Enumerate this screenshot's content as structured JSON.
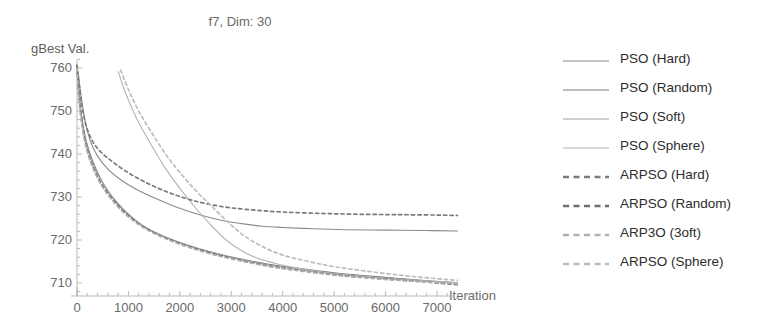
{
  "chart_data": {
    "type": "line",
    "title": "f7, Dim: 30",
    "xlabel": "Iteration",
    "ylabel": "gBest Val.",
    "xlim": [
      0,
      7700
    ],
    "ylim": [
      705,
      762
    ],
    "xticks": [
      0,
      1000,
      2000,
      3000,
      4000,
      5000,
      6000,
      7000
    ],
    "yticks": [
      710,
      720,
      730,
      740,
      750,
      760
    ],
    "grid": false,
    "legend_position": "right",
    "series": [
      {
        "name": "PSO (Hard)",
        "style": "solid",
        "color": "#8a8a8a",
        "x": [
          0,
          40,
          90,
          160,
          260,
          400,
          600,
          850,
          1150,
          1500,
          1900,
          2350,
          2800,
          3200,
          3600,
          4000,
          4600,
          5200,
          6000,
          6800,
          7400
        ],
        "y": [
          760.5,
          757.0,
          752.5,
          747.5,
          743.0,
          739.5,
          736.5,
          734.0,
          731.8,
          729.8,
          727.8,
          726.0,
          724.6,
          723.8,
          723.2,
          722.9,
          722.6,
          722.4,
          722.3,
          722.2,
          722.1
        ]
      },
      {
        "name": "PSO (Random)",
        "style": "solid",
        "color": "#7c7c7c",
        "x": [
          0,
          40,
          100,
          180,
          300,
          450,
          650,
          900,
          1250,
          1650,
          2100,
          2600,
          3100,
          3700,
          4300,
          5000,
          5700,
          6400,
          7100,
          7400
        ],
        "y": [
          760.3,
          754.0,
          748.0,
          743.0,
          738.5,
          734.5,
          730.5,
          727.0,
          723.5,
          721.0,
          719.0,
          717.2,
          715.8,
          714.4,
          713.4,
          712.4,
          711.6,
          710.9,
          710.3,
          710.1
        ]
      },
      {
        "name": "PSO (Soft)",
        "style": "solid",
        "color": "#a4a4a4",
        "x": [
          0,
          40,
          100,
          180,
          300,
          460,
          680,
          950,
          1300,
          1700,
          2150,
          2650,
          3200,
          3800,
          4400,
          5100,
          5900,
          6700,
          7400
        ],
        "y": [
          760.4,
          753.5,
          747.5,
          742.5,
          738.0,
          734.0,
          730.2,
          726.6,
          723.2,
          720.8,
          718.8,
          717.0,
          715.4,
          714.0,
          713.0,
          712.0,
          711.2,
          710.5,
          710.0
        ]
      },
      {
        "name": "PSO (Sphere)",
        "style": "solid",
        "color": "#b4b4b4",
        "x": [
          800,
          950,
          1150,
          1400,
          1700,
          2000,
          2300,
          2600,
          2900,
          3200,
          3500,
          3900,
          4300,
          4800,
          5400,
          6000,
          6700,
          7400
        ],
        "y": [
          759.2,
          754.0,
          748.5,
          743.0,
          737.0,
          732.0,
          727.5,
          723.5,
          720.0,
          717.5,
          715.8,
          714.4,
          713.4,
          712.5,
          711.7,
          711.1,
          710.5,
          710.1
        ]
      },
      {
        "name": "ARPSO (Hard)",
        "style": "dashed",
        "color": "#7a7a7a",
        "x": [
          0,
          40,
          100,
          180,
          300,
          460,
          680,
          950,
          1300,
          1750,
          2250,
          2800,
          3400,
          4000,
          4700,
          5400,
          6200,
          7000,
          7400
        ],
        "y": [
          760.6,
          756.5,
          751.0,
          746.5,
          743.0,
          740.5,
          738.3,
          736.0,
          733.6,
          731.2,
          729.2,
          727.8,
          727.0,
          726.5,
          726.2,
          726.0,
          725.9,
          725.8,
          725.7
        ]
      },
      {
        "name": "ARPSO (Random)",
        "style": "dashed",
        "color": "#6f6f6f",
        "x": [
          0,
          40,
          100,
          180,
          300,
          460,
          680,
          950,
          1300,
          1700,
          2150,
          2650,
          3200,
          3800,
          4400,
          5100,
          5900,
          6700,
          7400
        ],
        "y": [
          760.2,
          753.0,
          747.0,
          741.8,
          737.4,
          733.4,
          729.6,
          726.2,
          723.0,
          720.6,
          718.6,
          716.8,
          715.2,
          713.8,
          712.8,
          711.8,
          711.0,
          710.3,
          709.6
        ]
      },
      {
        "name": "ARP3O (3oft)",
        "style": "dashed",
        "color": "#b0b0b0",
        "x": [
          0,
          40,
          100,
          180,
          300,
          460,
          680,
          950,
          1300,
          1700,
          2150,
          2650,
          3200,
          3800,
          4400,
          5100,
          5900,
          6700,
          7400
        ],
        "y": [
          760.0,
          752.5,
          746.5,
          741.4,
          737.0,
          733.0,
          729.3,
          725.9,
          722.8,
          720.4,
          718.4,
          716.6,
          715.1,
          713.7,
          712.7,
          711.7,
          710.9,
          710.3,
          709.8
        ]
      },
      {
        "name": "ARPSO (Sphere)",
        "style": "dashed",
        "color": "#bcbcbc",
        "x": [
          850,
          1000,
          1200,
          1450,
          1750,
          2050,
          2350,
          2650,
          2950,
          3250,
          3600,
          4000,
          4500,
          5000,
          5600,
          6300,
          7000,
          7400
        ],
        "y": [
          759.5,
          755.0,
          750.0,
          745.0,
          739.5,
          735.0,
          731.0,
          727.5,
          724.0,
          721.0,
          718.5,
          716.5,
          715.0,
          713.8,
          712.8,
          711.8,
          711.0,
          710.6
        ]
      }
    ]
  },
  "legend": {
    "items": [
      {
        "label": "PSO (Hard)"
      },
      {
        "label": "PSO (Random)"
      },
      {
        "label": "PSO (Soft)"
      },
      {
        "label": "PSO (Sphere)"
      },
      {
        "label": "ARPSO (Hard)"
      },
      {
        "label": "ARPSO (Random)"
      },
      {
        "label": "ARP3O (3oft)"
      },
      {
        "label": "ARPSO (Sphere)"
      }
    ]
  },
  "axes": {
    "axis_color": "#b9b9b9",
    "tick_color": "#6a6a6a"
  }
}
